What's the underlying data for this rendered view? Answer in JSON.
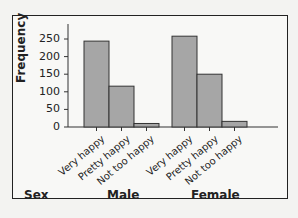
{
  "chart_data": {
    "type": "bar",
    "title": "",
    "xlabel": "Sex",
    "ylabel": "Frequency",
    "ylim": [
      0,
      275
    ],
    "yticks": [
      0,
      50,
      100,
      150,
      200,
      250
    ],
    "groups": [
      {
        "name": "Male",
        "categories": [
          "Very happy",
          "Pretty happy",
          "Not too happy"
        ],
        "values": [
          244,
          116,
          10
        ]
      },
      {
        "name": "Female",
        "categories": [
          "Very happy",
          "Pretty happy",
          "Not too happy"
        ],
        "values": [
          258,
          150,
          16
        ]
      }
    ],
    "bar_color": "#a6a6a6",
    "grid": false,
    "legend": null
  },
  "labels": {
    "ylabel": "Frequency",
    "sex": "Sex",
    "male": "Male",
    "female": "Female"
  }
}
